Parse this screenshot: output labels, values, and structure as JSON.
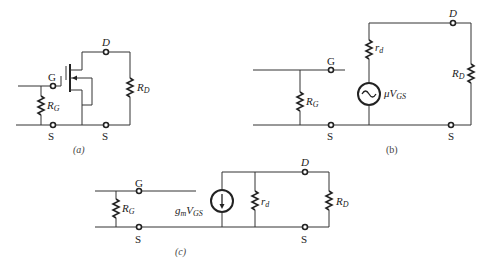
{
  "figure": {
    "panels": [
      {
        "id": "a",
        "caption": "(a)",
        "description": "MOSFET with gate resistor and drain resistor",
        "labels": {
          "gate": "G",
          "drain": "D",
          "source_left": "S",
          "source_right": "S",
          "rg_main": "R",
          "rg_sub": "G",
          "rd_main": "R",
          "rd_sub": "D"
        }
      },
      {
        "id": "b",
        "caption": "(b)",
        "description": "Voltage-source equivalent circuit",
        "labels": {
          "gate": "G",
          "drain": "D",
          "source_left": "S",
          "source_right": "S",
          "rg_main": "R",
          "rg_sub": "G",
          "rd_main": "R",
          "rd_sub": "D",
          "rd_small_main": "r",
          "rd_small_sub": "d",
          "source_main": "μV",
          "source_sub": "GS"
        }
      },
      {
        "id": "c",
        "caption": "(c)",
        "description": "Current-source equivalent circuit",
        "labels": {
          "gate": "G",
          "drain": "D",
          "source_left": "S",
          "source_right": "S",
          "rg_main": "R",
          "rg_sub": "G",
          "rd_main": "R",
          "rd_sub": "D",
          "rd_small_main": "r",
          "rd_small_sub": "d",
          "gm_main": "g",
          "gm_sub1": "m",
          "gm_mid": "V",
          "gm_sub2": "GS"
        }
      }
    ]
  }
}
